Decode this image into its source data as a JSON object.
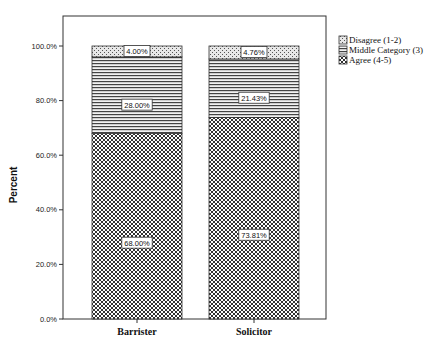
{
  "chart_data": {
    "type": "bar",
    "stacked": true,
    "title": "",
    "xlabel": "",
    "ylabel": "Percent",
    "ylim": [
      0,
      100
    ],
    "yticks": [
      "0.0%",
      "20.0%",
      "40.0%",
      "60.0%",
      "80.0%",
      "100.0%"
    ],
    "categories": [
      "Barrister",
      "Solicitor"
    ],
    "series": [
      {
        "name": "Agree (4-5)",
        "values": [
          68.0,
          73.81
        ],
        "labels": [
          "68.00%",
          "73.81%"
        ],
        "pattern": "crosshatch"
      },
      {
        "name": "Middle Category (3)",
        "values": [
          28.0,
          21.43
        ],
        "labels": [
          "28.00%",
          "21.43%"
        ],
        "pattern": "horizontal-lines"
      },
      {
        "name": "Disagree (1-2)",
        "values": [
          4.0,
          4.76
        ],
        "labels": [
          "4.00%",
          "4.76%"
        ],
        "pattern": "dots"
      }
    ],
    "legend": {
      "position": "right",
      "entries": [
        "Disagree (1-2)",
        "Middle Category (3)",
        "Agree (4-5)"
      ]
    },
    "grid": false
  }
}
